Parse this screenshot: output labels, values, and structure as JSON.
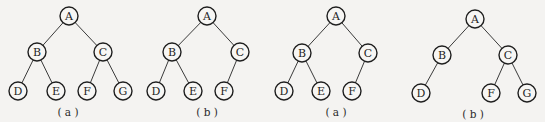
{
  "figure": {
    "trees": [
      {
        "caption": "( a )",
        "nodes": [
          "A",
          "B",
          "C",
          "D",
          "E",
          "F",
          "G"
        ],
        "edges": [
          [
            "A",
            "B"
          ],
          [
            "A",
            "C"
          ],
          [
            "B",
            "D"
          ],
          [
            "B",
            "E"
          ],
          [
            "C",
            "F"
          ],
          [
            "C",
            "G"
          ]
        ]
      },
      {
        "caption": "( b )",
        "nodes": [
          "A",
          "B",
          "C",
          "D",
          "E",
          "F"
        ],
        "edges": [
          [
            "A",
            "B"
          ],
          [
            "A",
            "C"
          ],
          [
            "B",
            "D"
          ],
          [
            "B",
            "E"
          ],
          [
            "C",
            "F"
          ]
        ]
      },
      {
        "caption": "( a )",
        "nodes": [
          "A",
          "B",
          "C",
          "D",
          "E",
          "F"
        ],
        "edges": [
          [
            "A",
            "B"
          ],
          [
            "A",
            "C"
          ],
          [
            "B",
            "D"
          ],
          [
            "B",
            "E"
          ],
          [
            "C",
            "F"
          ]
        ]
      },
      {
        "caption": "( b )",
        "nodes": [
          "A",
          "B",
          "C",
          "D",
          "F",
          "G"
        ],
        "edges": [
          [
            "A",
            "B"
          ],
          [
            "A",
            "C"
          ],
          [
            "B",
            "D"
          ],
          [
            "C",
            "F"
          ],
          [
            "C",
            "G"
          ]
        ]
      }
    ]
  }
}
